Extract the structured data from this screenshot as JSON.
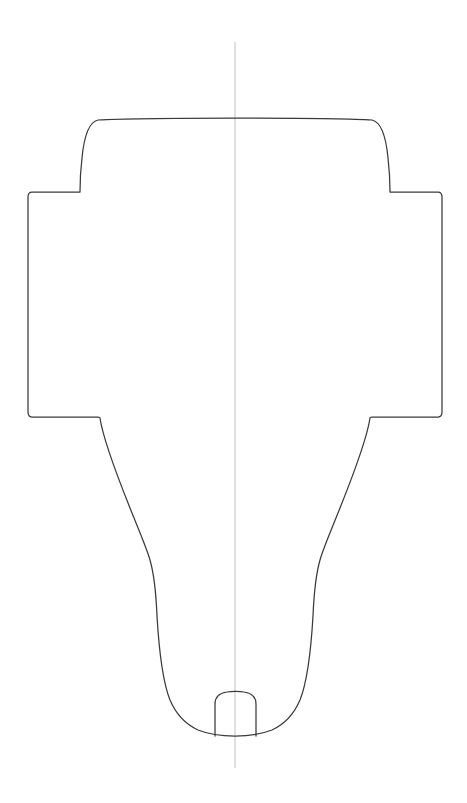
{
  "document": {
    "title": "Technical Outline Drawing",
    "background_color": "#ffffff",
    "canvas_width": 467,
    "canvas_height": 803
  },
  "style": {
    "outline_stroke_color": "#3a3a3a",
    "outline_stroke_width": 1.25,
    "centerline_stroke_color": "#b9b9b9",
    "centerline_stroke_width": 0.9,
    "fill": "none"
  },
  "geometry": {
    "centerline": {
      "name": "vertical-axis-of-symmetry",
      "x": 235,
      "y_top": 42,
      "y_bottom": 768,
      "path": "M 235 42 L 235 768"
    },
    "outline": {
      "name": "part-outline",
      "symmetry": "mirror about x = 235",
      "extents": {
        "x_min": 25,
        "x_max": 438,
        "y_min": 120,
        "y_max": 736
      },
      "key_points": {
        "dome_top_left_corner": [
          98,
          120
        ],
        "dome_top_right_corner": [
          372,
          120
        ],
        "shoulder_step_left": [
          80,
          192
        ],
        "shoulder_step_right": [
          390,
          192
        ],
        "flange_top_left": [
          25,
          195
        ],
        "flange_top_right": [
          438,
          195
        ],
        "flange_bottom_left": [
          25,
          415
        ],
        "flange_bottom_right": [
          438,
          415
        ],
        "waist_step_left": [
          97,
          418
        ],
        "waist_step_right": [
          370,
          418
        ],
        "taper_inflection_left": [
          148,
          560
        ],
        "taper_inflection_right": [
          320,
          560
        ],
        "bottom_curve_left": [
          167,
          718
        ],
        "bottom_curve_right": [
          300,
          718
        ],
        "bottom_center": [
          235,
          736
        ]
      },
      "path": "M 98 120 C 128 118 190 118 235 118 C 280 118 344 118 372 120 C 381 122 386 137 388 158 C 390 175 390 186 390 192 L 438 192 C 441 192 442 194 442 197 L 442 412 C 442 415 441 417 438 417 L 372 417 C 371 417 370 417 370 418 C 368 432 356 468 340 508 C 330 533 323 549 320 560 C 316 574 314 592 313 616 C 311 650 308 680 300 700 C 294 714 285 724 272 730 C 262 734 249 736 235 736 C 221 736 208 734 198 730 C 185 724 176 714 170 700 C 162 680 159 650 157 616 C 156 592 154 574 150 560 C 147 549 140 533 130 508 C 114 468 102 432 100 418 C 100 417 99 417 98 417 L 32 417 C 29 417 28 415 28 412 L 28 197 C 28 194 29 192 32 192 L 80 192 C 80 186 80 175 82 158 C 84 137 89 122 98 120 Z"
    },
    "center_notch": {
      "name": "center-notch-tab",
      "x_left": 214,
      "x_right": 257,
      "y_top": 692,
      "y_bottom": 736,
      "path": "M 215 736 L 215 704 C 215 697 220 693 227 692 C 231 691 240 691 244 692 C 251 693 256 697 256 704 L 256 736"
    }
  },
  "labels": {
    "drawing_type": "2D symmetric outline profile",
    "annotations": []
  }
}
